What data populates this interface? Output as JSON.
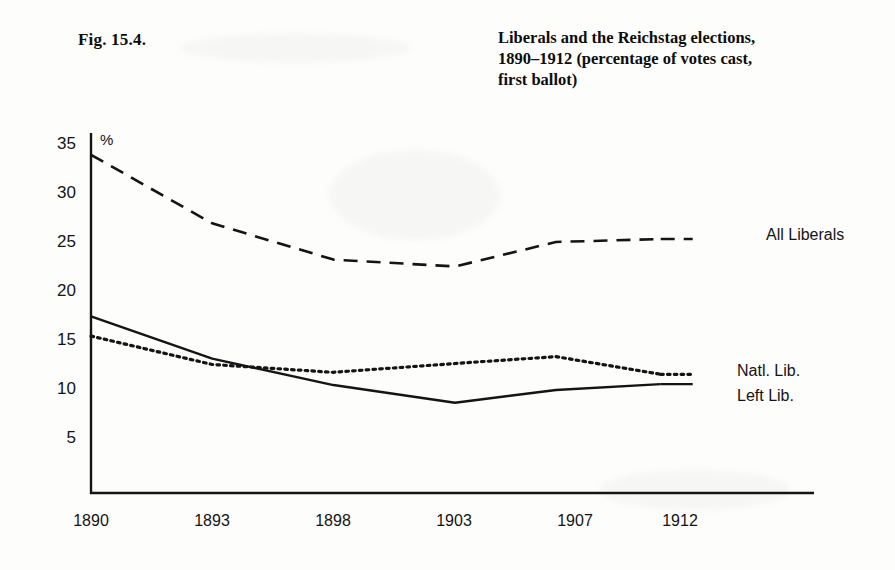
{
  "figure": {
    "label": "Fig. 15.4.",
    "title_lines": [
      "Liberals and the Reichstag elections,",
      "1890–1912 (percentage of votes cast,",
      "first ballot)"
    ]
  },
  "axis": {
    "y_unit_symbol": "%",
    "y_ticks": [
      "35",
      "30",
      "25",
      "20",
      "15",
      "10",
      "5"
    ],
    "x_ticks": [
      "1890",
      "1893",
      "1898",
      "1903",
      "1907",
      "1912"
    ]
  },
  "series_labels": {
    "all_liberals": "All Liberals",
    "natl_lib": "Natl. Lib.",
    "left_lib": "Left Lib."
  },
  "colors": {
    "ink": "#141414",
    "paper": "#fdfdfc"
  },
  "chart_data": {
    "type": "line",
    "title": "Liberals and the Reichstag elections, 1890–1912 (percentage of votes cast, first ballot)",
    "xlabel": "",
    "ylabel": "%",
    "x": [
      "1890",
      "1893",
      "1898",
      "1903",
      "1907",
      "1912"
    ],
    "ylim": [
      0,
      35
    ],
    "yticks": [
      5,
      10,
      15,
      20,
      25,
      30,
      35
    ],
    "grid": false,
    "legend": "right-inline-labels",
    "series": [
      {
        "name": "All Liberals",
        "style": "dashed",
        "values": [
          33.8,
          26.8,
          23.1,
          22.4,
          24.9,
          25.2
        ]
      },
      {
        "name": "Natl. Lib.",
        "style": "dotted",
        "values": [
          15.3,
          12.4,
          11.6,
          12.5,
          13.2,
          11.4
        ]
      },
      {
        "name": "Left Lib.",
        "style": "solid",
        "values": [
          17.3,
          13.0,
          10.3,
          8.5,
          9.8,
          10.4
        ]
      }
    ]
  }
}
